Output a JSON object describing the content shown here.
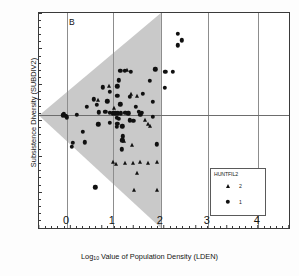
{
  "panel": {
    "label": "B"
  },
  "axes": {
    "xlabel_prefix": "Log",
    "xlabel_sub": "10",
    "xlabel_rest": " Value of Population Density (LDEN)",
    "ylabel": "Subsistence Diversity (SUBDIV2)",
    "x_major_ticks": [
      "-1.0",
      "-.5",
      "0.0",
      ".5",
      "1.0",
      "1.5",
      "2.0",
      "2.5",
      "3.0"
    ],
    "y_major_ticks": [
      "100",
      "90",
      "80",
      "70",
      "60",
      "50",
      "40"
    ],
    "big_numerals": [
      "0",
      "1",
      "2",
      "3",
      "4"
    ]
  },
  "legend": {
    "title": "HUNTFIL2",
    "entries": [
      {
        "symbol": "triangle",
        "label": "2"
      },
      {
        "symbol": "circle",
        "label": "1"
      }
    ]
  },
  "colors": {
    "shade": "#c9c9c9",
    "marker": "#101010",
    "gridline": "#8d8d8d",
    "frame": "#3a3a3a"
  },
  "chart_data": {
    "type": "scatter",
    "title": "B",
    "xlabel": "Log10 Value of Population Density (LDEN)",
    "ylabel": "Subsistence Diversity (SUBDIV2)",
    "xlim": [
      -1.0,
      3.0
    ],
    "ylim": [
      40,
      100
    ],
    "grid": true,
    "legend_position": "lower-right",
    "legend_title": "HUNTFIL2",
    "annotations": [
      {
        "text": "B",
        "x": -0.52,
        "y": 98.0
      },
      {
        "text": "0",
        "x": -0.55,
        "y": 41.5
      },
      {
        "text": "1",
        "x": 0.18,
        "y": 41.5
      },
      {
        "text": "2",
        "x": 0.95,
        "y": 41.5
      },
      {
        "text": "3",
        "x": 1.7,
        "y": 41.5
      },
      {
        "text": "4",
        "x": 2.5,
        "y": 41.5
      }
    ],
    "vertical_gridlines": [
      -0.55,
      0.18,
      0.95,
      1.7,
      2.5
    ],
    "horizontal_gridlines": [
      71.5
    ],
    "shaded_region": {
      "shape": "triangle",
      "description": "grey wedge with apex at left axis, opening rightward",
      "vertices": [
        [
          -1.0,
          71.5
        ],
        [
          0.95,
          100.0
        ],
        [
          0.95,
          40.0
        ]
      ]
    },
    "series": [
      {
        "name": "1",
        "marker": "circle",
        "points": [
          [
            1.22,
            94.2
          ],
          [
            1.28,
            92.4
          ],
          [
            1.22,
            91.0
          ],
          [
            0.3,
            83.8
          ],
          [
            0.37,
            83.8
          ],
          [
            0.47,
            83.6
          ],
          [
            0.86,
            84.3
          ],
          [
            1.02,
            83.6
          ],
          [
            1.14,
            83.6
          ],
          [
            0.28,
            81.2
          ],
          [
            0.77,
            81.1
          ],
          [
            0.02,
            79.3
          ],
          [
            0.25,
            79.5
          ],
          [
            1.01,
            79.2
          ],
          [
            0.13,
            78.0
          ],
          [
            0.66,
            77.5
          ],
          [
            0.25,
            76.9
          ],
          [
            0.45,
            76.6
          ],
          [
            -0.12,
            75.9
          ],
          [
            0.09,
            75.4
          ],
          [
            0.82,
            75.3
          ],
          [
            -0.08,
            74.3
          ],
          [
            0.3,
            74.5
          ],
          [
            -0.24,
            73.9
          ],
          [
            0.55,
            73.8
          ],
          [
            -0.62,
            71.5
          ],
          [
            -0.58,
            71.3
          ],
          [
            -0.6,
            71.9
          ],
          [
            -0.56,
            70.9
          ],
          [
            -0.4,
            71.6
          ],
          [
            -0.04,
            72.3
          ],
          [
            0.06,
            72.4
          ],
          [
            0.13,
            72.1
          ],
          [
            0.18,
            72.0
          ],
          [
            0.22,
            72.0
          ],
          [
            0.26,
            72.0
          ],
          [
            0.31,
            72.0
          ],
          [
            0.38,
            72.2
          ],
          [
            0.43,
            72.0
          ],
          [
            0.6,
            72.4
          ],
          [
            0.64,
            72.2
          ],
          [
            0.62,
            71.6
          ],
          [
            0.82,
            71.0
          ],
          [
            0.24,
            70.8
          ],
          [
            0.28,
            70.4
          ],
          [
            0.45,
            70.1
          ],
          [
            0.51,
            69.9
          ],
          [
            0.13,
            69.3
          ],
          [
            0.25,
            69.0
          ],
          [
            -0.05,
            68.9
          ],
          [
            0.24,
            68.3
          ],
          [
            0.33,
            68.4
          ],
          [
            -0.3,
            66.9
          ],
          [
            0.34,
            65.6
          ],
          [
            0.33,
            64.5
          ],
          [
            -0.46,
            63.8
          ],
          [
            -0.27,
            63.9
          ],
          [
            0.88,
            63.4
          ],
          [
            -0.48,
            62.6
          ],
          [
            0.32,
            62.0
          ],
          [
            -0.1,
            51.4
          ]
        ]
      },
      {
        "name": "2",
        "marker": "triangle",
        "points": [
          [
            0.4,
            84.2
          ],
          [
            0.12,
            79.7
          ],
          [
            0.47,
            77.4
          ],
          [
            0.56,
            76.8
          ],
          [
            -0.05,
            75.6
          ],
          [
            0.2,
            73.4
          ],
          [
            0.7,
            70.2
          ],
          [
            0.74,
            69.0
          ],
          [
            0.78,
            68.5
          ],
          [
            0.36,
            64.2
          ],
          [
            0.48,
            63.3
          ],
          [
            0.18,
            58.3
          ],
          [
            0.23,
            58.0
          ],
          [
            0.38,
            58.2
          ],
          [
            0.5,
            58.2
          ],
          [
            0.62,
            58.3
          ],
          [
            0.74,
            58.2
          ],
          [
            0.88,
            58.3
          ],
          [
            0.56,
            55.3
          ],
          [
            0.52,
            50.6
          ],
          [
            0.88,
            50.6
          ]
        ]
      }
    ]
  }
}
